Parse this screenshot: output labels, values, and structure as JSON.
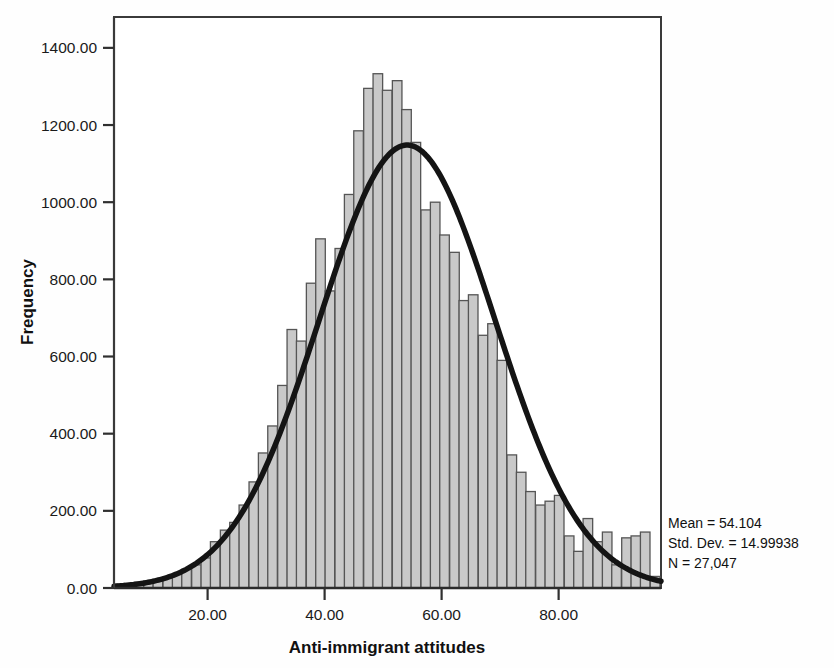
{
  "chart_data": {
    "type": "bar",
    "title": "",
    "subtitle": "",
    "xlabel": "Anti-immigrant attitudes",
    "ylabel": "Frequency",
    "xlim": [
      4.0,
      97.5
    ],
    "ylim": [
      0,
      1480
    ],
    "xticks": [
      20,
      40,
      60,
      80
    ],
    "xtick_labels": [
      "20.00",
      "40.00",
      "60.00",
      "80.00"
    ],
    "yticks": [
      0,
      200,
      400,
      600,
      800,
      1000,
      1200,
      1400
    ],
    "ytick_labels": [
      "0.00",
      "200.00",
      "400.00",
      "600.00",
      "800.00",
      "1000.00",
      "1200.00",
      "1400.00"
    ],
    "grid": false,
    "legend": null,
    "bin_width": 1.636,
    "bar_fill": "#c9c9c9",
    "bar_edge": "#555555",
    "curve_color": "#141414",
    "curve_label": "normal",
    "annotations": [
      "Mean = 54.104",
      "Std. Dev. = 14.99938",
      "N = 27,047"
    ],
    "statistics": {
      "mean": 54.104,
      "std_dev": 14.99938,
      "n": 27047,
      "n_label": "27,047"
    },
    "series": [
      {
        "name": "Frequency",
        "bin_centers": [
          5.0,
          6.6,
          8.3,
          9.9,
          11.5,
          13.2,
          14.8,
          16.4,
          18.1,
          19.7,
          21.3,
          23.0,
          24.6,
          26.2,
          27.9,
          29.5,
          31.1,
          32.8,
          34.4,
          36.0,
          37.7,
          39.3,
          40.9,
          42.6,
          44.2,
          45.8,
          47.5,
          49.1,
          50.7,
          52.4,
          54.0,
          55.6,
          57.3,
          58.9,
          60.5,
          62.2,
          63.8,
          65.4,
          67.1,
          68.7,
          70.3,
          72.0,
          73.6,
          75.2,
          76.9,
          78.5,
          80.1,
          81.8,
          83.4,
          85.0,
          86.7,
          88.3,
          89.9,
          91.6,
          93.2,
          94.8,
          96.5
        ],
        "values": [
          10,
          12,
          15,
          18,
          22,
          28,
          36,
          48,
          60,
          78,
          120,
          150,
          170,
          215,
          275,
          350,
          420,
          525,
          670,
          640,
          790,
          905,
          770,
          880,
          1020,
          1185,
          1295,
          1333,
          1290,
          1315,
          1240,
          1155,
          980,
          1000,
          915,
          870,
          745,
          760,
          655,
          685,
          590,
          345,
          300,
          250,
          215,
          225,
          240,
          135,
          95,
          180,
          120,
          145,
          60,
          130,
          135,
          145,
          30
        ]
      }
    ],
    "normal_curve": {
      "peak_value": 1148,
      "peak_x": 54.1,
      "mean": 54.104,
      "std_dev": 14.99938
    }
  },
  "figure": {
    "frame": {
      "left": 114,
      "top": 17,
      "right": 661,
      "bottom": 588
    }
  }
}
